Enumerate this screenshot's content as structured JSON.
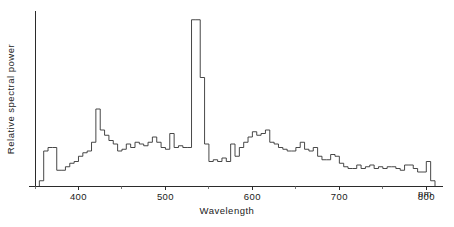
{
  "figure": {
    "background_color": "#ffffff",
    "line_color": "#333333",
    "axis_color": "#2b2b2b"
  },
  "axes": {
    "x_title": "Wavelength",
    "x_unit": "nm",
    "y_title": "Relative  spectral  power",
    "x_tick_labels": [
      "400",
      "500",
      "600",
      "700",
      "800"
    ],
    "x_tick_values": [
      400,
      500,
      600,
      700,
      800
    ],
    "x_minor_tick_values": [
      350,
      450,
      550,
      650,
      750
    ],
    "y_tick_labels": []
  },
  "chart_data": {
    "type": "line",
    "title": "",
    "subtitle": "",
    "xlabel": "Wavelength",
    "ylabel": "Relative spectral power",
    "xlim": [
      350,
      810
    ],
    "ylim": [
      0,
      100
    ],
    "xunit": "nm",
    "grid": false,
    "legend": null,
    "style": "step-post",
    "bin_width_nm": 5,
    "annotations": [
      {
        "text": "dominant emission spike",
        "x": 535,
        "y": 96
      },
      {
        "text": "secondary peak",
        "x": 418,
        "y": 44
      }
    ],
    "series": [
      {
        "name": "Relative spectral power",
        "x": [
          355,
          360,
          365,
          370,
          375,
          380,
          385,
          390,
          395,
          400,
          405,
          410,
          415,
          420,
          425,
          430,
          435,
          440,
          445,
          450,
          455,
          460,
          465,
          470,
          475,
          480,
          485,
          490,
          495,
          500,
          505,
          510,
          515,
          520,
          525,
          530,
          535,
          540,
          545,
          550,
          555,
          560,
          565,
          570,
          575,
          580,
          585,
          590,
          595,
          600,
          605,
          610,
          615,
          620,
          625,
          630,
          635,
          640,
          645,
          650,
          655,
          660,
          665,
          670,
          675,
          680,
          685,
          690,
          695,
          700,
          705,
          710,
          715,
          720,
          725,
          730,
          735,
          740,
          745,
          750,
          755,
          760,
          765,
          770,
          775,
          780,
          785,
          790,
          795,
          800,
          805
        ],
        "values": [
          3,
          20,
          22,
          22,
          9,
          9,
          11,
          13,
          14,
          17,
          19,
          20,
          25,
          44,
          32,
          29,
          26,
          24,
          20,
          21,
          24,
          22,
          25,
          24,
          23,
          25,
          28,
          25,
          22,
          21,
          30,
          22,
          23,
          22,
          22,
          95,
          95,
          62,
          24,
          14,
          15,
          14,
          16,
          14,
          24,
          17,
          22,
          25,
          28,
          31,
          29,
          30,
          32,
          25,
          24,
          22,
          21,
          20,
          20,
          22,
          25,
          21,
          20,
          22,
          17,
          15,
          15,
          18,
          17,
          13,
          11,
          10,
          10,
          12,
          10,
          11,
          12,
          10,
          11,
          10,
          11,
          11,
          10,
          9,
          12,
          12,
          10,
          8,
          8,
          14,
          3
        ]
      }
    ]
  }
}
